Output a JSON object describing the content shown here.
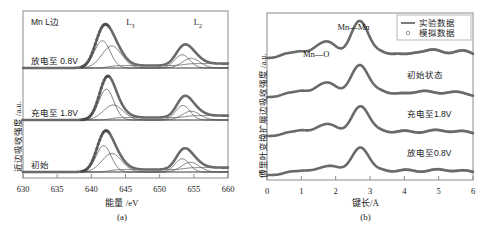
{
  "figure": {
    "panel_a": {
      "caption": "(a)",
      "corner_label": "Mn L边",
      "xlabel": "能量 /eV",
      "ylabel": "近边吸收强度 /a.u.",
      "peak_labels": [
        {
          "base": "L",
          "sub": "3"
        },
        {
          "base": "L",
          "sub": "2"
        }
      ],
      "curve_labels": [
        "放电至 0.8V",
        "充电至 1.8V",
        "初始"
      ],
      "xticks": [
        "630",
        "635",
        "640",
        "645",
        "650",
        "655",
        "660"
      ]
    },
    "panel_b": {
      "caption": "(b)",
      "xlabel": "键长/Å",
      "ylabel": "傅里叶变换扩展边吸收强度 /a.u.",
      "bond_labels": [
        "Mn—O",
        "Mn—Mn"
      ],
      "curve_labels": [
        "标准谱",
        "初始状态",
        "充电至1.8V",
        "放电至0.8V"
      ],
      "legend": [
        {
          "label": "实验数据",
          "marker": "line"
        },
        {
          "label": "模拟数据",
          "marker": "circle"
        }
      ],
      "xticks": [
        "0",
        "1",
        "2",
        "3",
        "4",
        "5",
        "6"
      ]
    }
  },
  "colors": {
    "frame": "#8c8c8c",
    "experimental_curve": "#6a6a6a",
    "fitted_component": "#4a4a4a",
    "simulated_marker": "#2a2a2a",
    "text": "#1a1a1a",
    "background": "#ffffff"
  },
  "chart_data": [
    {
      "type": "line",
      "panel": "a",
      "title": "Mn L边",
      "xlabel": "能量 /eV",
      "ylabel": "近边吸收强度 /a.u.",
      "xlim": [
        630,
        660
      ],
      "xticks": [
        630,
        635,
        640,
        645,
        650,
        655,
        660
      ],
      "grid": false,
      "legend_position": "none",
      "annotations": [
        "Mn L边",
        "L3",
        "L2"
      ],
      "series": [
        {
          "name": "放电至 0.8V",
          "baseline_offset": 2.0,
          "peaks": [
            {
              "center": 641.6,
              "height": 0.62,
              "width": 1.15
            },
            {
              "center": 643.0,
              "height": 0.5,
              "width": 1.45
            },
            {
              "center": 653.3,
              "height": 0.3,
              "width": 1.1
            },
            {
              "center": 654.6,
              "height": 0.22,
              "width": 1.3
            }
          ],
          "step_edges": [
            {
              "center": 642.5,
              "height": 0.055
            },
            {
              "center": 653.5,
              "height": 0.045
            }
          ]
        },
        {
          "name": "充电至 1.8V",
          "baseline_offset": 1.0,
          "peaks": [
            {
              "center": 642.2,
              "height": 0.7,
              "width": 1.1
            },
            {
              "center": 643.2,
              "height": 0.34,
              "width": 1.45
            },
            {
              "center": 653.4,
              "height": 0.33,
              "width": 1.05
            },
            {
              "center": 654.6,
              "height": 0.2,
              "width": 1.3
            }
          ],
          "step_edges": [
            {
              "center": 642.8,
              "height": 0.055
            },
            {
              "center": 653.8,
              "height": 0.045
            }
          ]
        },
        {
          "name": "初始",
          "baseline_offset": 0.0,
          "peaks": [
            {
              "center": 641.8,
              "height": 0.6,
              "width": 1.1
            },
            {
              "center": 643.0,
              "height": 0.42,
              "width": 1.45
            },
            {
              "center": 653.3,
              "height": 0.3,
              "width": 1.05
            },
            {
              "center": 654.5,
              "height": 0.22,
              "width": 1.3
            }
          ],
          "step_edges": [
            {
              "center": 642.6,
              "height": 0.055
            },
            {
              "center": 653.6,
              "height": 0.045
            }
          ]
        }
      ]
    },
    {
      "type": "line",
      "panel": "b",
      "title": "",
      "xlabel": "键长/Å",
      "ylabel": "傅里叶变换扩展边吸收强度 /a.u.",
      "xlim": [
        0,
        6
      ],
      "xticks": [
        0,
        1,
        2,
        3,
        4,
        5,
        6
      ],
      "grid": false,
      "legend_position": "top-right",
      "legend_entries": [
        "实验数据",
        "模拟数据"
      ],
      "annotations": [
        "Mn—O",
        "Mn—Mn"
      ],
      "series": [
        {
          "name": "标准谱",
          "baseline_offset": 3.0,
          "peaks": [
            {
              "center": 0.55,
              "height": 0.1,
              "width": 0.18
            },
            {
              "center": 0.95,
              "height": 0.16,
              "width": 0.2
            },
            {
              "center": 1.4,
              "height": 0.14,
              "width": 0.2
            },
            {
              "center": 1.78,
              "height": 0.42,
              "width": 0.26
            },
            {
              "center": 2.7,
              "height": 1.0,
              "width": 0.26
            },
            {
              "center": 3.3,
              "height": 0.13,
              "width": 0.2
            },
            {
              "center": 3.8,
              "height": 0.1,
              "width": 0.22
            },
            {
              "center": 4.3,
              "height": 0.1,
              "width": 0.22
            },
            {
              "center": 4.85,
              "height": 0.22,
              "width": 0.28
            },
            {
              "center": 5.7,
              "height": 0.2,
              "width": 0.28
            }
          ]
        },
        {
          "name": "初始状态",
          "baseline_offset": 2.0,
          "peaks": [
            {
              "center": 0.6,
              "height": 0.09,
              "width": 0.18
            },
            {
              "center": 1.0,
              "height": 0.15,
              "width": 0.2
            },
            {
              "center": 1.45,
              "height": 0.12,
              "width": 0.2
            },
            {
              "center": 1.8,
              "height": 0.36,
              "width": 0.26
            },
            {
              "center": 2.7,
              "height": 0.86,
              "width": 0.26
            },
            {
              "center": 3.3,
              "height": 0.14,
              "width": 0.22
            },
            {
              "center": 3.9,
              "height": 0.09,
              "width": 0.24
            },
            {
              "center": 4.6,
              "height": 0.16,
              "width": 0.3
            },
            {
              "center": 5.5,
              "height": 0.14,
              "width": 0.3
            }
          ]
        },
        {
          "name": "充电至1.8V",
          "baseline_offset": 1.0,
          "peaks": [
            {
              "center": 0.6,
              "height": 0.08,
              "width": 0.18
            },
            {
              "center": 1.0,
              "height": 0.14,
              "width": 0.2
            },
            {
              "center": 1.45,
              "height": 0.11,
              "width": 0.2
            },
            {
              "center": 1.82,
              "height": 0.3,
              "width": 0.26
            },
            {
              "center": 2.72,
              "height": 0.8,
              "width": 0.26
            },
            {
              "center": 3.3,
              "height": 0.12,
              "width": 0.22
            },
            {
              "center": 4.0,
              "height": 0.14,
              "width": 0.28
            },
            {
              "center": 4.9,
              "height": 0.16,
              "width": 0.3
            },
            {
              "center": 5.7,
              "height": 0.13,
              "width": 0.28
            }
          ]
        },
        {
          "name": "放电至0.8V",
          "baseline_offset": 0.0,
          "peaks": [
            {
              "center": 0.65,
              "height": 0.07,
              "width": 0.18
            },
            {
              "center": 1.05,
              "height": 0.1,
              "width": 0.22
            },
            {
              "center": 1.5,
              "height": 0.1,
              "width": 0.22
            },
            {
              "center": 1.9,
              "height": 0.22,
              "width": 0.26
            },
            {
              "center": 2.72,
              "height": 0.74,
              "width": 0.26
            },
            {
              "center": 3.35,
              "height": 0.11,
              "width": 0.22
            },
            {
              "center": 4.05,
              "height": 0.14,
              "width": 0.28
            },
            {
              "center": 4.95,
              "height": 0.15,
              "width": 0.3
            },
            {
              "center": 5.75,
              "height": 0.12,
              "width": 0.28
            }
          ]
        }
      ]
    }
  ]
}
